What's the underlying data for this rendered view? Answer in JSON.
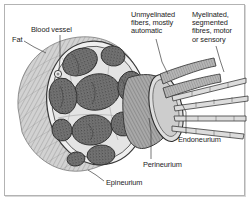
{
  "figure": {
    "style": "grayscale stippled anatomical line drawing",
    "border_color": "#b3b3b3",
    "background": "#ffffff",
    "ink_color": "#1c1c1c"
  },
  "labels": {
    "fat": "Fat",
    "blood_vessel": "Blood vessel",
    "unmyelinated": "Unmyelinated\nfibers, mostly\nautomatic",
    "myelinated": "Myelinated,\nsegmented\nfibres, motor\nor sensory",
    "endoneurium": "Endoneurium",
    "perineurium": "Perineurium",
    "epineurium": "Epineurium"
  },
  "anatomy": {
    "fascicle_count": 10,
    "fascicle_fill": "#6e6e6e",
    "fat_fill": "#c9c9c9",
    "matrix_fill": "#e8e8e8",
    "nerve_trunk_fill": "#9a9a9a",
    "fiber_bundle_count": 5
  }
}
